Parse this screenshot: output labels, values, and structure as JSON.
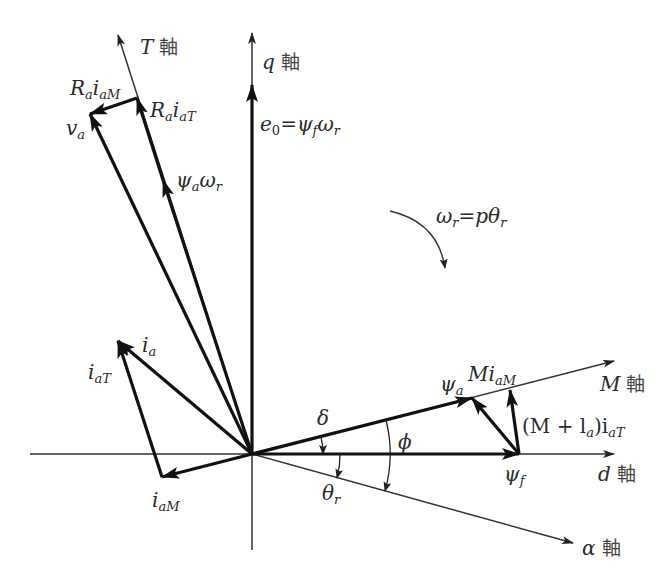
{
  "diagram": {
    "type": "phasor-vector-diagram",
    "colors": {
      "ink": "#1a1a1a",
      "thin": "#333333",
      "background": "#ffffff"
    },
    "origin": [
      252,
      454
    ],
    "axes": [
      {
        "id": "d",
        "label_sym": "d",
        "label_suffix": "軸",
        "from": [
          30,
          454
        ],
        "to": [
          614,
          454
        ]
      },
      {
        "id": "q",
        "label_sym": "q",
        "label_suffix": "軸",
        "from": [
          252,
          550
        ],
        "to": [
          252,
          33
        ]
      },
      {
        "id": "M",
        "label_sym": "M",
        "label_suffix": "軸",
        "from": [
          252,
          454
        ],
        "to": [
          614,
          361
        ]
      },
      {
        "id": "T",
        "label_sym": "T",
        "label_suffix": "軸",
        "from": [
          252,
          454
        ],
        "to": [
          118,
          35
        ]
      },
      {
        "id": "alpha",
        "label_sym": "α",
        "label_suffix": "軸",
        "from": [
          252,
          454
        ],
        "to": [
          573,
          543
        ]
      }
    ],
    "vectors": [
      {
        "id": "e0",
        "from": [
          252,
          454
        ],
        "to": [
          252,
          85
        ]
      },
      {
        "id": "psi_f",
        "from": [
          252,
          454
        ],
        "to": [
          519,
          454
        ]
      },
      {
        "id": "psi_a",
        "from": [
          252,
          454
        ],
        "to": [
          472,
          398
        ]
      },
      {
        "id": "Mi_aM",
        "from": [
          519,
          454
        ],
        "to": [
          472,
          398
        ]
      },
      {
        "id": "Ml_i_aT",
        "from": [
          519,
          454
        ],
        "to": [
          510,
          390
        ]
      },
      {
        "id": "i_a",
        "from": [
          252,
          454
        ],
        "to": [
          118,
          341
        ]
      },
      {
        "id": "i_aM",
        "from": [
          252,
          454
        ],
        "to": [
          162,
          477
        ]
      },
      {
        "id": "i_aT",
        "from": [
          162,
          477
        ],
        "to": [
          118,
          341
        ]
      },
      {
        "id": "psi_a_omega_r",
        "from": [
          252,
          454
        ],
        "to": [
          163,
          180
        ]
      },
      {
        "id": "Ra_i_aT",
        "from": [
          163,
          180
        ],
        "to": [
          137,
          98
        ]
      },
      {
        "id": "Ra_i_aM",
        "from": [
          137,
          98
        ],
        "to": [
          90,
          114
        ]
      },
      {
        "id": "v_a",
        "from": [
          252,
          454
        ],
        "to": [
          90,
          114
        ]
      }
    ],
    "labels": {
      "T_axis": {
        "sym": "T",
        "kanji": "軸"
      },
      "q_axis": {
        "sym": "q",
        "kanji": "軸"
      },
      "M_axis": {
        "sym": "M",
        "kanji": "軸"
      },
      "d_axis": {
        "sym": "d",
        "kanji": "軸"
      },
      "alpha_axis": {
        "sym": "α",
        "kanji": "軸"
      },
      "e0": {
        "base": "e",
        "sub": "0",
        "eq": "=",
        "rhs_base1": "ψ",
        "rhs_sub1": "f",
        "rhs_base2": "ω",
        "rhs_sub2": "r"
      },
      "omega": {
        "base1": "ω",
        "sub1": "r",
        "eq": "=",
        "rhs": "pθ",
        "rhs_sub": "r"
      },
      "Ra_i_aM": {
        "base": "R",
        "sub1": "a",
        "mid": "i",
        "sub2": "aM"
      },
      "Ra_i_aT": {
        "base": "R",
        "sub1": "a",
        "mid": "i",
        "sub2": "aT"
      },
      "v_a": {
        "base": "v",
        "sub": "a"
      },
      "psi_a_omega_r": {
        "base1": "ψ",
        "sub1": "a",
        "base2": "ω",
        "sub2": "r"
      },
      "i_a": {
        "base": "i",
        "sub": "a"
      },
      "i_aT": {
        "base": "i",
        "sub": "aT"
      },
      "i_aM": {
        "base": "i",
        "sub": "aM"
      },
      "psi_a": {
        "base": "ψ",
        "sub": "a"
      },
      "Mi_aM": {
        "base": "Mi",
        "sub": "aM"
      },
      "Ml_i_aT": {
        "open": "(M + l",
        "sub1": "a",
        "close": ")i",
        "sub2": "aT"
      },
      "psi_f": {
        "base": "ψ",
        "sub": "f"
      },
      "delta": {
        "text": "δ"
      },
      "phi": {
        "text": "ϕ"
      },
      "theta_r": {
        "base": "θ",
        "sub": "r"
      }
    }
  }
}
